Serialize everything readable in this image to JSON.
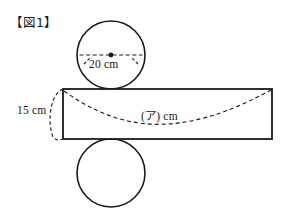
{
  "figure": {
    "caption": "【図1】",
    "background_color": "#ffffff",
    "stroke_color": "#1a1a1a",
    "labels": {
      "diameter": "20 cm",
      "height": "15 cm",
      "length": "(ア) cm"
    },
    "shapes": {
      "top_circle": {
        "cx": 111,
        "cy": 55,
        "r": 34
      },
      "bottom_circle": {
        "cx": 111,
        "cy": 173,
        "r": 34
      },
      "rectangle": {
        "x": 63,
        "y": 89,
        "width": 209,
        "height": 50
      }
    }
  }
}
